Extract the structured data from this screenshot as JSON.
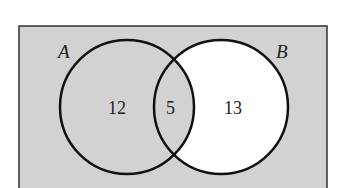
{
  "diagram": {
    "type": "venn",
    "universe_fill": "#d2d2d2",
    "set_a": {
      "label": "A",
      "only_count": "12",
      "fill": "#d2d2d2"
    },
    "set_b": {
      "label": "B",
      "only_count": "13",
      "fill": "#ffffff"
    },
    "intersection": {
      "count": "5",
      "fill": "#d2d2d2"
    },
    "stroke_color": "#111111"
  }
}
